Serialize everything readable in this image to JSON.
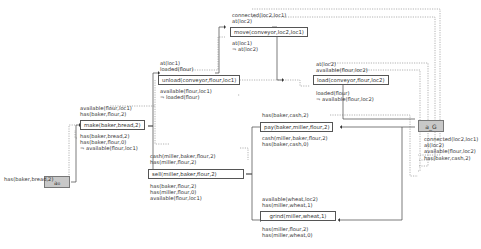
{
  "diagram": {
    "type": "partial-order plan graph",
    "init_node": {
      "label": "a₀",
      "effect": "has(baker,bread,2)"
    },
    "goal_node": {
      "label": "a_G",
      "preconditions": [
        "connected(loc2,loc1)",
        "at(loc2)",
        "available(flour,loc2)",
        "has(baker,cash,2)"
      ]
    },
    "actions": [
      {
        "id": "make",
        "label": "make(baker,bread,2)",
        "pre": [
          "available(flour,loc1)",
          "has(baker,flour,2)"
        ],
        "eff": [
          "has(baker,bread,2)",
          "has(baker,flour,0)",
          "¬ available(flour,loc1)"
        ]
      },
      {
        "id": "unload",
        "label": "unload(conveyor,flour,loc1)",
        "pre": [
          "at(loc1)",
          "loaded(flour)"
        ],
        "eff": [
          "available(flour,loc1)",
          "¬ loaded(flour)"
        ]
      },
      {
        "id": "move",
        "label": "move(conveyor,loc2,loc1)",
        "pre": [
          "connected(loc2,loc1)",
          "at(loc2)"
        ],
        "eff": [
          "at(loc1)",
          "¬ at(loc2)"
        ]
      },
      {
        "id": "load",
        "label": "load(conveyor,flour,loc2)",
        "pre": [
          "at(loc2)",
          "available(flour,loc2)"
        ],
        "eff": [
          "loaded(flour)",
          "¬ available(flour,loc2)"
        ]
      },
      {
        "id": "pay",
        "label": "pay(baker,miller,flour,2)",
        "pre": [
          "has(baker,cash,2)"
        ],
        "eff": [
          "cash(miller,baker,flour,2)",
          "has(baker,cash,0)"
        ]
      },
      {
        "id": "sell",
        "label": "sell(miller,baker,flour,2)",
        "pre": [
          "cash(miller,baker,flour,2)",
          "has(miller,flour,2)"
        ],
        "eff": [
          "has(baker,flour,2)",
          "has(miller,flour,0)",
          "available(flour,loc1)"
        ]
      },
      {
        "id": "grind",
        "label": "grind(miller,wheat,1)",
        "pre": [
          "available(wheat,loc2)",
          "has(miller,wheat,1)"
        ],
        "eff": [
          "has(miller,flour,2)",
          "has(miller,wheat,0)"
        ]
      }
    ]
  }
}
